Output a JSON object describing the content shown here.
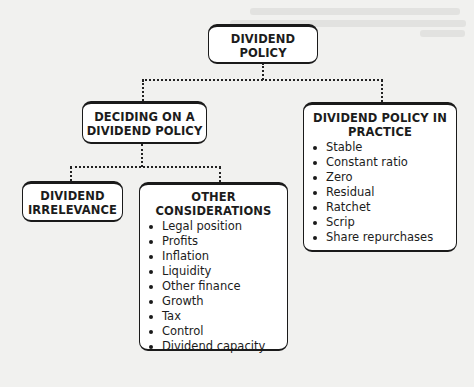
{
  "diagram": {
    "root": {
      "label": "DIVIDEND POLICY",
      "line1": "DIVIDEND",
      "line2": "POLICY"
    },
    "deciding": {
      "label": "DECIDING ON A DIVIDEND POLICY",
      "line1": "DECIDING ON A",
      "line2": "DIVIDEND POLICY"
    },
    "practice": {
      "label": "DIVIDEND POLICY IN PRACTICE",
      "line1": "DIVIDEND POLICY IN",
      "line2": "PRACTICE",
      "items": [
        "Stable",
        "Constant ratio",
        "Zero",
        "Residual",
        "Ratchet",
        "Scrip",
        "Share repurchases"
      ]
    },
    "irrelevance": {
      "label": "DIVIDEND IRRELEVANCE",
      "line1": "DIVIDEND",
      "line2": "IRRELEVANCE"
    },
    "other": {
      "label": "OTHER CONSIDERATIONS",
      "items": [
        "Legal position",
        "Profits",
        "Inflation",
        "Liquidity",
        "Other finance",
        "Growth",
        "Tax",
        "Control",
        "Dividend capacity"
      ]
    },
    "edges": [
      {
        "from": "DIVIDEND POLICY",
        "to": "DECIDING ON A DIVIDEND POLICY"
      },
      {
        "from": "DIVIDEND POLICY",
        "to": "DIVIDEND POLICY IN PRACTICE"
      },
      {
        "from": "DECIDING ON A DIVIDEND POLICY",
        "to": "DIVIDEND IRRELEVANCE"
      },
      {
        "from": "DECIDING ON A DIVIDEND POLICY",
        "to": "OTHER CONSIDERATIONS"
      }
    ],
    "colors": {
      "background": "#f1f1ef",
      "box_fill": "#ffffff",
      "stroke": "#1a1a1a"
    }
  }
}
